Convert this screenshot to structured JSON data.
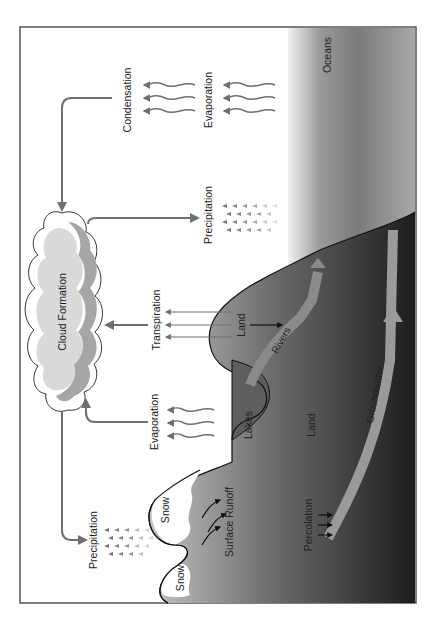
{
  "diagram": {
    "orientation": "rotated-90-ccw",
    "colors": {
      "frame": "#555555",
      "arrow": "#6f6f6f",
      "sky": "#ffffff",
      "cloud_outline": "#333333",
      "cloud_fill": "#d9d9d9",
      "cloud_shadow": "#a6a6a6",
      "ocean_light": "#c8c8c8",
      "ocean_dark": "#6a6a6a",
      "land_light": "#b5b5b5",
      "land_dark": "#1e1e1e",
      "river": "#8a8a8a",
      "groundwater": "#9a9a9a",
      "snow": "#ffffff"
    },
    "labels": {
      "cloud": "Cloud Formation",
      "condensation": "Condensation",
      "evaporation_ocean": "Evaporation",
      "oceans": "Oceans",
      "precipitation_ocean": "Precipitation",
      "transpiration": "Transpiration",
      "land_hill": "Land",
      "rivers": "Rivers",
      "groundwater": "Groundwater",
      "evaporation_lake": "Evaporation",
      "lakes": "Lakes",
      "land_main": "Land",
      "precipitation_mountain": "Precipitation",
      "snow_1": "Snow",
      "snow_2": "Snow",
      "surface_runoff": "Surface Runoff",
      "percolation": "Percolation"
    }
  }
}
